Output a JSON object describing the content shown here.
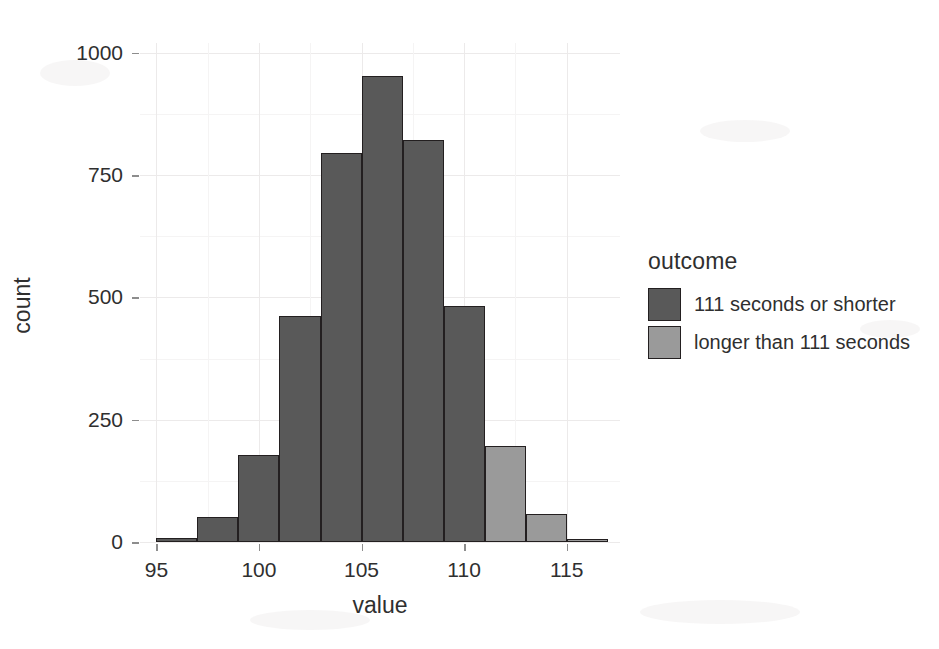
{
  "chart_data": {
    "type": "bar",
    "title": "",
    "subtitle": "",
    "xlabel": "value",
    "ylabel": "count",
    "xlim": [
      94.2,
      117.6
    ],
    "ylim": [
      0,
      1020
    ],
    "grid": true,
    "legend_position": "right",
    "x_ticks": [
      "95",
      "100",
      "105",
      "110",
      "115"
    ],
    "x_tick_values": [
      95,
      100,
      105,
      110,
      115
    ],
    "y_ticks": [
      "0",
      "250",
      "500",
      "750",
      "1000"
    ],
    "y_tick_values": [
      0,
      250,
      500,
      750,
      1000
    ],
    "bin_width": 2,
    "bins": [
      {
        "x_start": 95,
        "x_end": 97,
        "center": 96,
        "value": 8,
        "group": "111 seconds or shorter"
      },
      {
        "x_start": 97,
        "x_end": 99,
        "center": 98,
        "value": 52,
        "group": "111 seconds or shorter"
      },
      {
        "x_start": 99,
        "x_end": 101,
        "center": 100,
        "value": 178,
        "group": "111 seconds or shorter"
      },
      {
        "x_start": 101,
        "x_end": 103,
        "center": 102,
        "value": 463,
        "group": "111 seconds or shorter"
      },
      {
        "x_start": 103,
        "x_end": 105,
        "center": 104,
        "value": 795,
        "group": "111 seconds or shorter"
      },
      {
        "x_start": 105,
        "x_end": 107,
        "center": 106,
        "value": 952,
        "group": "111 seconds or shorter"
      },
      {
        "x_start": 107,
        "x_end": 109,
        "center": 108,
        "value": 822,
        "group": "111 seconds or shorter"
      },
      {
        "x_start": 109,
        "x_end": 111,
        "center": 110,
        "value": 483,
        "group": "111 seconds or shorter"
      },
      {
        "x_start": 111,
        "x_end": 113,
        "center": 112,
        "value": 197,
        "group": "longer than 111 seconds"
      },
      {
        "x_start": 113,
        "x_end": 115,
        "center": 114,
        "value": 58,
        "group": "longer than 111 seconds"
      },
      {
        "x_start": 115,
        "x_end": 117,
        "center": 116,
        "value": 5,
        "group": "longer than 111 seconds"
      }
    ],
    "series": [
      {
        "name": "111 seconds or shorter",
        "color": "#595959",
        "categories": [
          96,
          98,
          100,
          102,
          104,
          106,
          108,
          110
        ],
        "values": [
          8,
          52,
          178,
          463,
          795,
          952,
          822,
          483
        ]
      },
      {
        "name": "longer than 111 seconds",
        "color": "#9a9a9a",
        "categories": [
          112,
          114,
          116
        ],
        "values": [
          197,
          58,
          5
        ]
      }
    ]
  },
  "legend": {
    "title": "outcome",
    "items": [
      {
        "label": "111 seconds or shorter",
        "color": "#595959"
      },
      {
        "label": "longer than 111 seconds",
        "color": "#9a9a9a"
      }
    ]
  },
  "colors": {
    "dark_gray": "#595959",
    "light_gray": "#9a9a9a",
    "bar_outline": "#231f20",
    "grid": "#ebe9e9",
    "text": "#2f2f2f",
    "background": "#ffffff"
  }
}
